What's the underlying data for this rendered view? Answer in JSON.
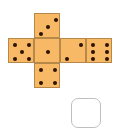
{
  "die_net": {
    "face_color": "#f7b965",
    "pip_color": "#2b1408",
    "faces": [
      {
        "name": "top",
        "value": 3,
        "left": 34,
        "top": 13,
        "pips": [
          [
            19,
            4
          ],
          [
            11,
            11
          ],
          [
            4,
            18
          ]
        ]
      },
      {
        "name": "left",
        "value": 5,
        "left": 8,
        "top": 38,
        "pips": [
          [
            4,
            4
          ],
          [
            18,
            4
          ],
          [
            11,
            11
          ],
          [
            4,
            18
          ],
          [
            18,
            18
          ]
        ]
      },
      {
        "name": "center",
        "value": 1,
        "left": 34,
        "top": 38,
        "pips": [
          [
            11,
            11
          ]
        ]
      },
      {
        "name": "right",
        "value": 2,
        "left": 60,
        "top": 38,
        "pips": [
          [
            18,
            4
          ],
          [
            4,
            18
          ]
        ]
      },
      {
        "name": "far-right",
        "value": 6,
        "left": 86,
        "top": 38,
        "pips": [
          [
            4,
            4
          ],
          [
            18,
            4
          ],
          [
            4,
            11
          ],
          [
            18,
            11
          ],
          [
            4,
            18
          ],
          [
            18,
            18
          ]
        ]
      },
      {
        "name": "bottom",
        "value": 4,
        "left": 34,
        "top": 63,
        "pips": [
          [
            4,
            4
          ],
          [
            18,
            4
          ],
          [
            4,
            17
          ],
          [
            18,
            17
          ]
        ]
      }
    ]
  },
  "answer_box": {
    "value": ""
  }
}
